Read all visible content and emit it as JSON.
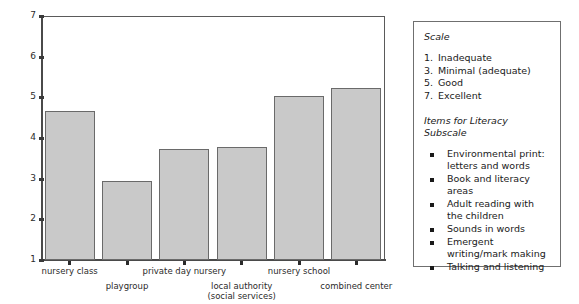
{
  "chart_data": {
    "type": "bar",
    "title": "",
    "xlabel": "",
    "ylabel": "",
    "ylim": [
      1,
      7
    ],
    "grid": false,
    "legend_position": "right-panel",
    "y_ticks": [
      "7",
      "6",
      "5",
      "4",
      "3",
      "2",
      "1"
    ],
    "categories": [
      "nursery class",
      "playgroup",
      "private day nursery",
      "local authority\n(social services)",
      "nursery school",
      "combined center"
    ],
    "category_lines": [
      [
        "nursery class"
      ],
      [
        "playgroup"
      ],
      [
        "private day nursery"
      ],
      [
        "local authority",
        "(social services)"
      ],
      [
        "nursery school"
      ],
      [
        "combined center"
      ]
    ],
    "values": [
      4.67,
      2.94,
      3.74,
      3.79,
      5.04,
      5.22
    ],
    "bar_fill": "#c9c9c9",
    "bar_stroke": "#6a6a6a"
  },
  "scale_panel": {
    "scale_heading": "Scale",
    "scale_levels": [
      {
        "num": "1.",
        "label": "Inadequate"
      },
      {
        "num": "3.",
        "label": "Minimal (adequate)"
      },
      {
        "num": "5.",
        "label": "Good"
      },
      {
        "num": "7.",
        "label": "Excellent"
      }
    ],
    "items_heading": "Items for Literacy Subscale",
    "items": [
      "Environmental print: letters and words",
      "Book and literacy areas",
      "Adult reading with the children",
      "Sounds in words",
      "Emergent writing/mark making",
      "Talking and listening"
    ]
  }
}
